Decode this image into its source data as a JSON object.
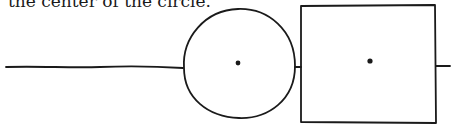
{
  "caption": {
    "text": "the center of the circle."
  },
  "diagram": {
    "stroke_color": "#1a1a1a",
    "elements": [
      {
        "type": "line",
        "label": "input-line"
      },
      {
        "type": "circle",
        "label": "circle",
        "has_center_dot": true
      },
      {
        "type": "line",
        "label": "circle-to-square-connector"
      },
      {
        "type": "square",
        "label": "square",
        "has_center_dot": true
      },
      {
        "type": "line",
        "label": "output-line"
      }
    ]
  }
}
